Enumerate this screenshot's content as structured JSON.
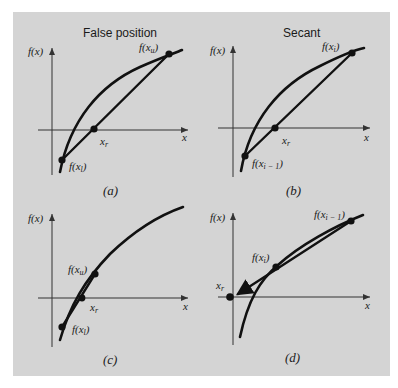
{
  "figure": {
    "panels": [
      {
        "id": "a",
        "title": "False position",
        "caption": "(a)",
        "y_axis_label": "f(x)",
        "x_axis_label": "x",
        "point_labels": {
          "upper": "f(x_u)",
          "lower": "f(x_l)",
          "root": "x_r"
        }
      },
      {
        "id": "b",
        "title": "Secant",
        "caption": "(b)",
        "y_axis_label": "f(x)",
        "x_axis_label": "x",
        "point_labels": {
          "upper": "f(x_i)",
          "lower": "f(x_i-1)",
          "root": "x_r"
        }
      },
      {
        "id": "c",
        "title": "",
        "caption": "(c)",
        "y_axis_label": "f(x)",
        "x_axis_label": "x",
        "point_labels": {
          "upper": "f(x_u)",
          "lower": "f(x_l)",
          "root": "x_r"
        }
      },
      {
        "id": "d",
        "title": "",
        "caption": "(d)",
        "y_axis_label": "f(x)",
        "x_axis_label": "x",
        "point_labels": {
          "upper": "f(x_i-1)",
          "middle": "f(x_i)",
          "root": "x_r"
        }
      }
    ],
    "colors": {
      "panel_background": "#d4d4d4",
      "ink": "#111111",
      "page": "#ffffff"
    }
  }
}
